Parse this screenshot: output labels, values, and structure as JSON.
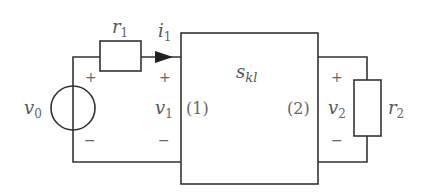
{
  "diagram": {
    "type": "two-port network circuit",
    "source": {
      "label": "v",
      "sub": "0",
      "plus": "+",
      "minus": "−"
    },
    "r1": {
      "label": "r",
      "sub": "1"
    },
    "current": {
      "label": "i",
      "sub": "1"
    },
    "port1": {
      "voltage": "v",
      "voltage_sub": "1",
      "plus": "+",
      "minus": "−",
      "id": "(1)"
    },
    "network": {
      "label": "s",
      "sub": "kl"
    },
    "port2": {
      "voltage": "v",
      "voltage_sub": "2",
      "plus": "+",
      "minus": "−",
      "id": "(2)"
    },
    "r2": {
      "label": "r",
      "sub": "2"
    }
  },
  "colors": {
    "line": "#333333",
    "text": "#555555",
    "background": "#ffffff"
  }
}
